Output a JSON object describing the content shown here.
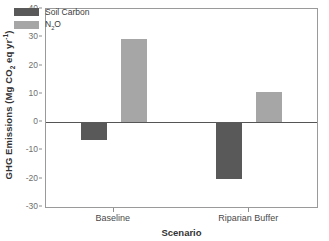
{
  "chart_data": {
    "type": "bar",
    "title": "",
    "xlabel": "Scenario",
    "ylabel": "GHG Emissions (Mg CO2 eq yr-1)",
    "ylabel_parts": {
      "prefix": "GHG Emissions (Mg CO",
      "sub": "2",
      "middle": " eq yr",
      "sup": "-1",
      "suffix": ")"
    },
    "categories": [
      "Baseline",
      "Riparian Buffer"
    ],
    "series": [
      {
        "name": "Soil Carbon",
        "color": "#595959",
        "values": [
          -6.3,
          -20.0
        ]
      },
      {
        "name": "N2O",
        "color": "#a6a6a6",
        "values": [
          29.4,
          10.6
        ]
      }
    ],
    "legend": [
      {
        "label": "Soil Carbon",
        "color": "#595959"
      },
      {
        "label": "N2O",
        "label_prefix": "N",
        "label_sub": "2",
        "label_suffix": "O"
      }
    ],
    "ylim": [
      -30,
      40
    ],
    "yticks": [
      40,
      30,
      20,
      10,
      0,
      -10,
      -20,
      -30
    ],
    "ytick_labels": [
      "40",
      "30",
      "20",
      "10",
      "0",
      "-10",
      "-20",
      "-30"
    ],
    "grid": false,
    "legend_position": "top-left",
    "frame": true,
    "zero_line": true
  }
}
